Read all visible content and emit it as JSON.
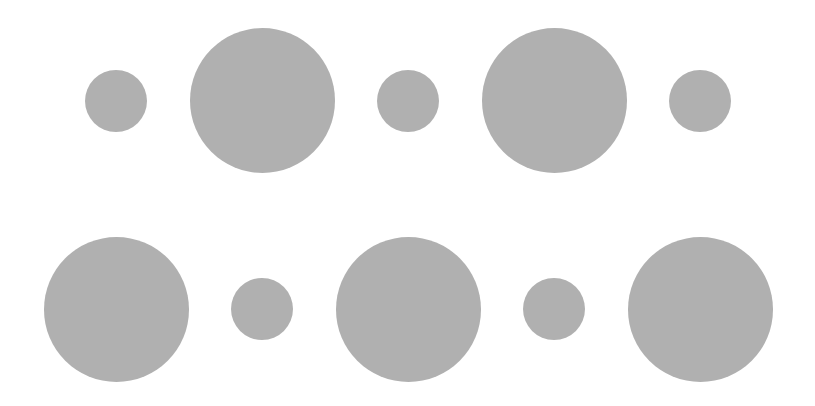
{
  "canvas": {
    "width": 815,
    "height": 406,
    "background": "#ffffff"
  },
  "style": {
    "circle_color": "#b0b0b0",
    "small_diameter": 62,
    "large_diameter": 145
  },
  "rows": [
    {
      "name": "top-row",
      "circles": [
        {
          "size": "small",
          "cx": 116,
          "cy": 101
        },
        {
          "size": "large",
          "cx": 262,
          "cy": 100
        },
        {
          "size": "small",
          "cx": 408,
          "cy": 101
        },
        {
          "size": "large",
          "cx": 554,
          "cy": 100
        },
        {
          "size": "small",
          "cx": 700,
          "cy": 101
        }
      ]
    },
    {
      "name": "bottom-row",
      "circles": [
        {
          "size": "large",
          "cx": 116,
          "cy": 309
        },
        {
          "size": "small",
          "cx": 262,
          "cy": 309
        },
        {
          "size": "large",
          "cx": 408,
          "cy": 309
        },
        {
          "size": "small",
          "cx": 554,
          "cy": 309
        },
        {
          "size": "large",
          "cx": 700,
          "cy": 309
        }
      ]
    }
  ]
}
